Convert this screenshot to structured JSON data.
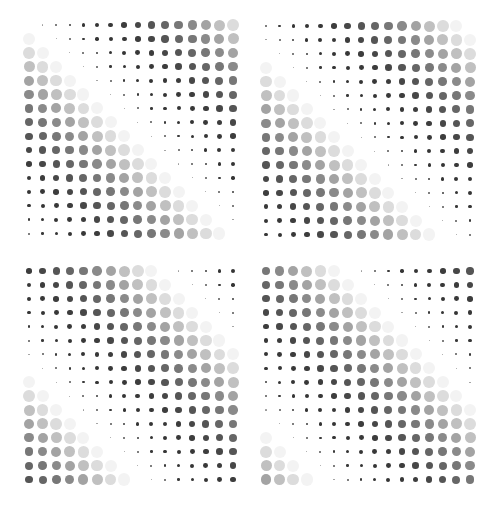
{
  "artwork": {
    "width": 499,
    "height": 507,
    "background": "#ffffff",
    "grid": {
      "cols": 16,
      "rows": 16,
      "col_spacing": 13.6,
      "row_spacing": 13.9,
      "period": 17,
      "rule": "v = (col - row + offset) mod period"
    },
    "levels": {
      "diameters": [
        0,
        1.2,
        2.0,
        2.6,
        3.4,
        4.0,
        4.8,
        5.6,
        6.6,
        7.3,
        8.0,
        8.7,
        9.4,
        10.2,
        11.0,
        11.8,
        12.2
      ],
      "colors": [
        "#ffffff",
        "#9a9a9a",
        "#555555",
        "#3a3a3a",
        "#353535",
        "#353535",
        "#383838",
        "#3d3d3d",
        "#474747",
        "#555555",
        "#666666",
        "#777777",
        "#8a8a8a",
        "#a3a3a3",
        "#c0c0c0",
        "#dcdcdc",
        "#f3f3f3"
      ]
    },
    "quadrants": [
      {
        "name": "top-left",
        "x0": 29,
        "y0": 25,
        "offset": 0
      },
      {
        "name": "top-right",
        "x0": 266,
        "y0": 26,
        "offset": 2
      },
      {
        "name": "bottom-left",
        "x0": 29,
        "y0": 271,
        "offset": 7
      },
      {
        "name": "bottom-right",
        "x0": 266,
        "y0": 271,
        "offset": 11
      }
    ]
  }
}
